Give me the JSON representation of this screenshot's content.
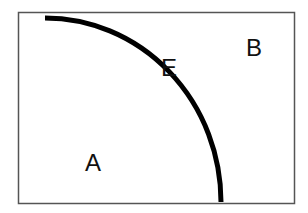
{
  "diagram": {
    "type": "production-possibilities-frontier",
    "frame": {
      "x": 18.5,
      "y": 12.5,
      "width": 276,
      "height": 191,
      "stroke": "#555555"
    },
    "curve": {
      "start": [
        45,
        18
      ],
      "end": [
        221,
        202
      ],
      "rx": 176,
      "ry": 184,
      "stroke": "#000000",
      "width": 5
    },
    "labels": {
      "a": "A",
      "b": "B",
      "e": "E"
    }
  }
}
